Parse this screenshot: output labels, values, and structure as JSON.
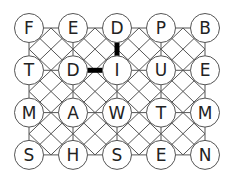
{
  "puzzle": {
    "type": "word-grid",
    "rows": 4,
    "cols": 5,
    "grid": [
      [
        "F",
        "E",
        "D",
        "P",
        "B"
      ],
      [
        "T",
        "D",
        "I",
        "U",
        "E"
      ],
      [
        "M",
        "A",
        "W",
        "T",
        "M"
      ],
      [
        "S",
        "H",
        "S",
        "E",
        "N"
      ]
    ],
    "walls": [
      {
        "from": [
          0,
          2
        ],
        "to": [
          1,
          2
        ],
        "orientation": "vertical"
      },
      {
        "from": [
          1,
          1
        ],
        "to": [
          1,
          2
        ],
        "orientation": "horizontal"
      }
    ]
  },
  "layout": {
    "x0": 29,
    "y0": 28,
    "dx": 44,
    "dy": 42.3,
    "r": 14.5
  },
  "colors": {
    "background": "#ffffff",
    "line": "#555555",
    "circle_stroke": "#555555",
    "circle_fill": "#ffffff",
    "text": "#222222",
    "wall": "#000000"
  }
}
